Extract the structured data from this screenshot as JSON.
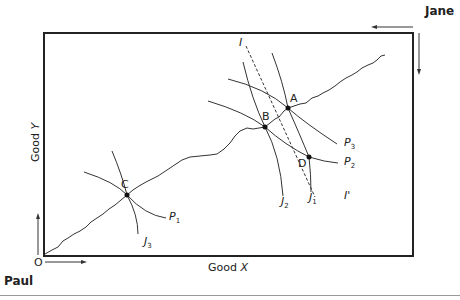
{
  "diagram": {
    "type": "edgeworth-box",
    "owners": {
      "top_right": "Jane",
      "bottom_left": "Paul"
    },
    "origin_label": "O",
    "axes": {
      "x_label_prefix": "Good ",
      "x_label_var": "X",
      "y_label_prefix": "Good ",
      "y_label_var": "Y"
    },
    "points": [
      {
        "id": "A",
        "label": "A"
      },
      {
        "id": "B",
        "label": "B"
      },
      {
        "id": "C",
        "label": "C"
      },
      {
        "id": "D",
        "label": "D"
      }
    ],
    "curves": {
      "P1": {
        "letter": "P",
        "sub": "1"
      },
      "P2": {
        "letter": "P",
        "sub": "2"
      },
      "P3": {
        "letter": "P",
        "sub": "3"
      },
      "J1": {
        "letter": "J",
        "sub": "1"
      },
      "J2": {
        "letter": "J",
        "sub": "2"
      },
      "J3": {
        "letter": "J",
        "sub": "3"
      }
    },
    "budget_line": {
      "start_label": "I",
      "end_label": "I'"
    },
    "colors": {
      "line": "#222222",
      "rule": "#999999",
      "background": "#ffffff"
    }
  }
}
